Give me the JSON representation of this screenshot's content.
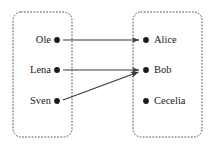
{
  "figure": {
    "type": "bipartite-mapping-diagram",
    "width": 213,
    "height": 148,
    "background_color": "#ffffff",
    "line_color": "#3a3a3a",
    "dot_color": "#1a1a1a",
    "text_color": "#1a1a1a",
    "box_border_color": "#555555",
    "box_border_style": "dotted",
    "box_corner_radius": 8
  },
  "domain_set": {
    "name": "domain-box",
    "box": {
      "x": 13,
      "y": 12,
      "width": 59,
      "height": 125
    },
    "nodes": [
      {
        "id": "ole",
        "label": "Ole",
        "dot_x": 57,
        "dot_y": 40,
        "label_x": 51,
        "label_y": 40
      },
      {
        "id": "lena",
        "label": "Lena",
        "dot_x": 57,
        "dot_y": 70,
        "label_x": 51,
        "label_y": 70
      },
      {
        "id": "sven",
        "label": "Sven",
        "dot_x": 57,
        "dot_y": 101,
        "label_x": 51,
        "label_y": 101
      }
    ]
  },
  "codomain_set": {
    "name": "codomain-box",
    "box": {
      "x": 133,
      "y": 12,
      "width": 69,
      "height": 125
    },
    "nodes": [
      {
        "id": "alice",
        "label": "Alice",
        "dot_x": 146,
        "dot_y": 40,
        "label_x": 154,
        "label_y": 40
      },
      {
        "id": "bob",
        "label": "Bob",
        "dot_x": 146,
        "dot_y": 70,
        "label_x": 154,
        "label_y": 70
      },
      {
        "id": "cecelia",
        "label": "Cecelia",
        "dot_x": 146,
        "dot_y": 101,
        "label_x": 154,
        "label_y": 101
      }
    ]
  },
  "arrows": [
    {
      "id": "ole-to-alice",
      "from": "ole",
      "to": "alice",
      "x1": 63,
      "y1": 40,
      "x2": 141,
      "y2": 40
    },
    {
      "id": "lena-to-bob",
      "from": "lena",
      "to": "bob",
      "x1": 63,
      "y1": 70,
      "x2": 141,
      "y2": 70
    },
    {
      "id": "sven-to-bob",
      "from": "sven",
      "to": "bob",
      "x1": 63,
      "y1": 100,
      "x2": 140,
      "y2": 72
    }
  ]
}
